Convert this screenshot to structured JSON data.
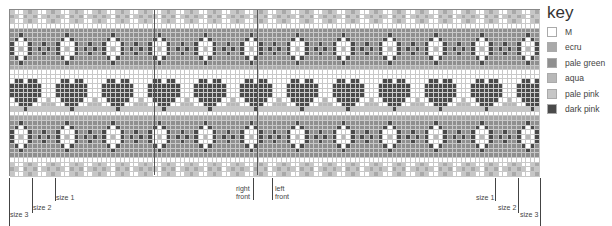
{
  "key": {
    "title": "key",
    "items": [
      {
        "label": "M",
        "color": "#ffffff"
      },
      {
        "label": "ecru",
        "color": "#a9a9a9"
      },
      {
        "label": "pale green",
        "color": "#8f8f8f"
      },
      {
        "label": "aqua",
        "color": "#b8b8b8"
      },
      {
        "label": "pale pink",
        "color": "#c6c6c6"
      },
      {
        "label": "dark pink",
        "color": "#4a4a4a"
      }
    ]
  },
  "chart": {
    "cols": 115,
    "rows": 36,
    "repeat_width": 10,
    "palette": {
      "W": "#ffffff",
      "E": "#a9a9a9",
      "G": "#8f8f8f",
      "A": "#b8b8b8",
      "P": "#c6c6c6",
      "D": "#4a4a4a"
    },
    "pattern_rows": [
      "PWWPEPWWPE",
      "EPWEPEWPEP",
      "PWWPEPWWPE",
      "WWWWWWWWWW",
      "GGGGGGGGGG",
      "GGDGGGGGGG",
      "GDWDGGGGGG",
      "DWWWDGGDGG",
      "DWAWDGDGDG",
      "DWWWDGGDGG",
      "GDWDGGGGGG",
      "GGDGGGGGGG",
      "EEEEEEEEEE",
      "WWWWWWWWWW",
      "WWWWWWWWWW",
      "WDDWDDWWWW",
      "DDDDDDDWWW",
      "DDDDDDDWWW",
      "DDDDDDDWWW",
      "WDDDDDWWAW",
      "WWDDDWWAAA",
      "PPPDPPPPPP",
      "WWWWWWWWWW",
      "EEEEEEEEEE",
      "GGDGGGGGGG",
      "GDWDGGGGGG",
      "DWWWDGGDGG",
      "DWAWDGDGDG",
      "DWWWDGGDGG",
      "GDWDGGGGGG",
      "GGDGGGGGGG",
      "GGGGGGGGGG",
      "WWWWWWWWWW",
      "PWWPEPWWPE",
      "EPWEPEWPEP",
      "PWWPEPWWPE"
    ],
    "center_lines_x": [
      153,
      256
    ]
  },
  "markers": [
    {
      "label": "size 3",
      "x": 9,
      "y1": 178,
      "y2": 226,
      "label_x": 10,
      "label_y": 211
    },
    {
      "label": "size 2",
      "x": 32,
      "y1": 178,
      "y2": 213,
      "label_x": 33,
      "label_y": 204
    },
    {
      "label": "size 1",
      "x": 55,
      "y1": 178,
      "y2": 201,
      "label_x": 56,
      "label_y": 194
    },
    {
      "label": "right\nfront",
      "x": 253,
      "y1": 178,
      "y2": 200,
      "label_x": 236,
      "label_y": 185
    },
    {
      "label": "left\nfront",
      "x": 272,
      "y1": 178,
      "y2": 200,
      "label_x": 275,
      "label_y": 185
    },
    {
      "label": "size 1",
      "x": 495,
      "y1": 178,
      "y2": 201,
      "label_x": 476,
      "label_y": 194
    },
    {
      "label": "size 2",
      "x": 518,
      "y1": 178,
      "y2": 213,
      "label_x": 498,
      "label_y": 204
    },
    {
      "label": "size 3",
      "x": 540,
      "y1": 178,
      "y2": 226,
      "label_x": 520,
      "label_y": 211
    }
  ]
}
